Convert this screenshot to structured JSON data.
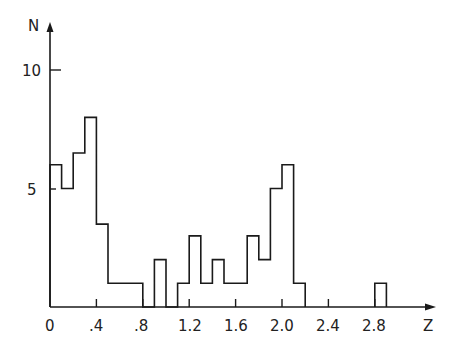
{
  "chart_data": {
    "type": "bar",
    "subtype": "step-histogram",
    "title": "",
    "xlabel": "Z",
    "ylabel": "N",
    "xlim": [
      0,
      3.3
    ],
    "ylim": [
      0,
      11
    ],
    "bin_width": 0.1,
    "x_ticks": [
      "0",
      ".4",
      ".8",
      "1.2",
      "1.6",
      "2.0",
      "2.4",
      "2.8"
    ],
    "x_tick_values": [
      0,
      0.4,
      0.8,
      1.2,
      1.6,
      2.0,
      2.4,
      2.8
    ],
    "y_ticks": [
      "5",
      "10"
    ],
    "y_tick_values": [
      5,
      10
    ],
    "grid": false,
    "legend": null,
    "bins": [
      {
        "x0": 0.0,
        "x1": 0.1,
        "n": 6
      },
      {
        "x0": 0.1,
        "x1": 0.2,
        "n": 5
      },
      {
        "x0": 0.2,
        "x1": 0.3,
        "n": 6.5
      },
      {
        "x0": 0.3,
        "x1": 0.4,
        "n": 8
      },
      {
        "x0": 0.4,
        "x1": 0.5,
        "n": 3.5
      },
      {
        "x0": 0.5,
        "x1": 0.6,
        "n": 1
      },
      {
        "x0": 0.6,
        "x1": 0.7,
        "n": 1
      },
      {
        "x0": 0.7,
        "x1": 0.8,
        "n": 1
      },
      {
        "x0": 0.8,
        "x1": 0.9,
        "n": 0
      },
      {
        "x0": 0.9,
        "x1": 1.0,
        "n": 2
      },
      {
        "x0": 1.0,
        "x1": 1.1,
        "n": 0
      },
      {
        "x0": 1.1,
        "x1": 1.2,
        "n": 1
      },
      {
        "x0": 1.2,
        "x1": 1.3,
        "n": 3
      },
      {
        "x0": 1.3,
        "x1": 1.4,
        "n": 1
      },
      {
        "x0": 1.4,
        "x1": 1.5,
        "n": 2
      },
      {
        "x0": 1.5,
        "x1": 1.6,
        "n": 1
      },
      {
        "x0": 1.6,
        "x1": 1.7,
        "n": 1
      },
      {
        "x0": 1.7,
        "x1": 1.8,
        "n": 3
      },
      {
        "x0": 1.8,
        "x1": 1.9,
        "n": 2
      },
      {
        "x0": 1.9,
        "x1": 2.0,
        "n": 5
      },
      {
        "x0": 2.0,
        "x1": 2.1,
        "n": 6
      },
      {
        "x0": 2.1,
        "x1": 2.2,
        "n": 1
      },
      {
        "x0": 2.8,
        "x1": 2.9,
        "n": 1
      }
    ]
  },
  "labels": {
    "y_axis": "N",
    "x_axis": "Z",
    "y10": "10",
    "y5": "5",
    "x0": "0",
    "x04": ".4",
    "x08": ".8",
    "x12": "1.2",
    "x16": "1.6",
    "x20": "2.0",
    "x24": "2.4",
    "x28": "2.8"
  },
  "colors": {
    "line": "#1a1a1a",
    "background": "#ffffff"
  }
}
